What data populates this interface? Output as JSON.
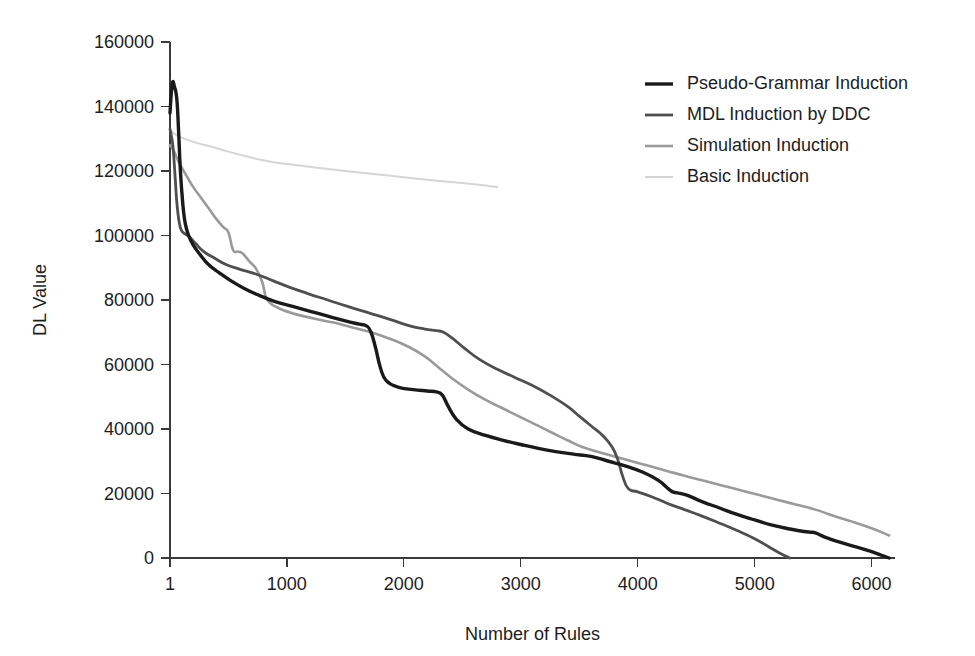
{
  "chart_data": {
    "type": "line",
    "title": "",
    "xlabel": "Number of Rules",
    "ylabel": "DL Value",
    "xlim": [
      1,
      6200
    ],
    "ylim": [
      0,
      160000
    ],
    "grid": false,
    "legend_position": "top-right",
    "xticks": [
      1,
      1000,
      2000,
      3000,
      4000,
      5000,
      6000
    ],
    "xtick_labels": [
      "1",
      "1000",
      "2000",
      "3000",
      "4000",
      "5000",
      "6000"
    ],
    "yticks": [
      0,
      20000,
      40000,
      60000,
      80000,
      100000,
      120000,
      140000,
      160000
    ],
    "ytick_labels": [
      "0",
      "20000",
      "40000",
      "60000",
      "80000",
      "100000",
      "120000",
      "140000",
      "160000"
    ],
    "series": [
      {
        "name": "Pseudo-Grammar Induction",
        "color": "#1a1a1a",
        "width": 3.4,
        "x": [
          1,
          20,
          40,
          60,
          75,
          90,
          110,
          130,
          160,
          200,
          260,
          330,
          420,
          520,
          640,
          760,
          900,
          1050,
          1200,
          1350,
          1500,
          1620,
          1680,
          1720,
          1760,
          1800,
          1850,
          1950,
          2080,
          2200,
          2280,
          2330,
          2380,
          2450,
          2550,
          2700,
          2850,
          3000,
          3150,
          3300,
          3450,
          3600,
          3750,
          3900,
          4050,
          4180,
          4260,
          4300,
          4340,
          4420,
          4550,
          4700,
          4850,
          5000,
          5150,
          5300,
          5420,
          5480,
          5520,
          5600,
          5720,
          5850,
          5980,
          6080,
          6150
        ],
        "y": [
          138000,
          147000,
          146000,
          142000,
          132000,
          120000,
          110000,
          104000,
          100000,
          97000,
          94000,
          91000,
          88500,
          86000,
          83500,
          81500,
          79500,
          78000,
          76500,
          75000,
          73500,
          72500,
          72000,
          70000,
          65000,
          59000,
          55000,
          53000,
          52200,
          51800,
          51500,
          50500,
          47000,
          43000,
          40000,
          38000,
          36500,
          35200,
          34000,
          33000,
          32200,
          31500,
          30000,
          28500,
          26500,
          24000,
          21500,
          20500,
          20200,
          19500,
          17500,
          15500,
          13500,
          11800,
          10200,
          9000,
          8200,
          8000,
          7800,
          6500,
          5000,
          3600,
          2200,
          900,
          0
        ]
      },
      {
        "name": "MDL Induction by DDC",
        "color": "#4f4f4f",
        "width": 2.8,
        "x": [
          1,
          25,
          45,
          60,
          80,
          100,
          130,
          170,
          220,
          290,
          380,
          480,
          600,
          740,
          880,
          1020,
          1180,
          1350,
          1520,
          1700,
          1880,
          2050,
          2180,
          2280,
          2340,
          2420,
          2520,
          2650,
          2800,
          2950,
          3100,
          3250,
          3400,
          3500,
          3600,
          3700,
          3780,
          3830,
          3870,
          3920,
          4000,
          4120,
          4250,
          4400,
          4550,
          4700,
          4850,
          5000,
          5120,
          5220,
          5300
        ],
        "y": [
          133000,
          128000,
          118000,
          110000,
          104000,
          101500,
          100500,
          99500,
          97500,
          95000,
          93000,
          91000,
          89500,
          88000,
          86000,
          84000,
          82000,
          80000,
          78000,
          76000,
          74000,
          72000,
          71000,
          70500,
          70000,
          68000,
          65000,
          61500,
          58500,
          56000,
          53500,
          50500,
          47000,
          44000,
          41000,
          38000,
          34500,
          30500,
          25500,
          21500,
          20500,
          19000,
          17000,
          15000,
          13000,
          10800,
          8500,
          6000,
          3500,
          1400,
          0
        ]
      },
      {
        "name": "Simulation Induction",
        "color": "#9a9a9a",
        "width": 2.6,
        "x": [
          1,
          30,
          55,
          80,
          110,
          150,
          200,
          260,
          330,
          400,
          460,
          500,
          540,
          580,
          620,
          680,
          740,
          790,
          820,
          860,
          900,
          960,
          1040,
          1140,
          1260,
          1400,
          1560,
          1720,
          1880,
          2040,
          2180,
          2300,
          2420,
          2560,
          2700,
          2840,
          2980,
          3120,
          3260,
          3400,
          3520,
          3650,
          3800,
          3950,
          4100,
          4250,
          4400,
          4560,
          4720,
          4880,
          5040,
          5200,
          5360,
          5520,
          5680,
          5840,
          6000,
          6150
        ],
        "y": [
          128000,
          126500,
          124500,
          122500,
          120500,
          118000,
          115000,
          112000,
          108500,
          105000,
          102500,
          101000,
          95500,
          95000,
          94500,
          92000,
          89500,
          85500,
          81000,
          79000,
          78000,
          77000,
          76000,
          75000,
          74000,
          73000,
          71500,
          70000,
          68000,
          65500,
          62500,
          59000,
          55500,
          52000,
          49000,
          46500,
          44000,
          41500,
          39000,
          36500,
          34500,
          33000,
          31500,
          30000,
          28500,
          27000,
          25500,
          24000,
          22500,
          21000,
          19500,
          18000,
          16500,
          15000,
          13000,
          11200,
          9200,
          7000
        ]
      },
      {
        "name": "Basic Induction",
        "color": "#d5d5d5",
        "width": 2.0,
        "x": [
          1,
          40,
          90,
          160,
          250,
          360,
          500,
          660,
          840,
          1040,
          1260,
          1500,
          1760,
          2020,
          2280,
          2520,
          2680,
          2800
        ],
        "y": [
          133000,
          131500,
          130500,
          129500,
          128500,
          127500,
          126000,
          124500,
          123000,
          122000,
          121000,
          120000,
          119000,
          118000,
          117000,
          116200,
          115600,
          115000
        ]
      }
    ]
  },
  "legend": {
    "entries": [
      {
        "label": "Pseudo-Grammar Induction"
      },
      {
        "label": "MDL Induction by DDC"
      },
      {
        "label": "Simulation Induction"
      },
      {
        "label": "Basic Induction"
      }
    ]
  }
}
